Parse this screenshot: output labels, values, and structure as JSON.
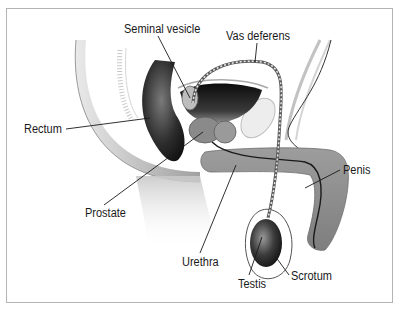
{
  "figure": {
    "border_color": "#b4b4b4",
    "labels": [
      {
        "id": "seminal-vesicle",
        "text": "Seminal vesicle",
        "x": 124,
        "y": 23
      },
      {
        "id": "vas-deferens",
        "text": "Vas deferens",
        "x": 226,
        "y": 30
      },
      {
        "id": "rectum",
        "text": "Rectum",
        "x": 24,
        "y": 123
      },
      {
        "id": "penis",
        "text": "Penis",
        "x": 343,
        "y": 164
      },
      {
        "id": "prostate",
        "text": "Prostate",
        "x": 85,
        "y": 207
      },
      {
        "id": "urethra",
        "text": "Urethra",
        "x": 182,
        "y": 256
      },
      {
        "id": "testis",
        "text": "Testis",
        "x": 238,
        "y": 278
      },
      {
        "id": "scrotum",
        "text": "Scrotum",
        "x": 291,
        "y": 270
      }
    ]
  }
}
